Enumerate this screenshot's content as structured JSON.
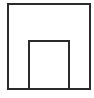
{
  "diagram": {
    "shapes": [
      {
        "type": "rectangle",
        "role": "outer-square",
        "stroke": "#2b2b2b",
        "fill": "#ffffff"
      },
      {
        "type": "rectangle",
        "role": "inner-rectangle",
        "stroke": "#2b2b2b",
        "fill": "#ffffff",
        "position": "bottom-center, sharing outer bottom edge"
      }
    ]
  }
}
